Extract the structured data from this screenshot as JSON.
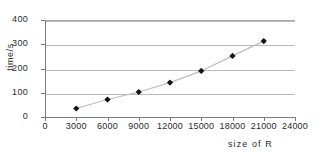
{
  "chart_data": {
    "type": "line",
    "title": "",
    "xlabel": "size of R",
    "ylabel": "time/s",
    "xlim": [
      0,
      24000
    ],
    "ylim": [
      0,
      400
    ],
    "grid": true,
    "legend": false,
    "x_ticks": [
      "0",
      "3000",
      "6000",
      "9000",
      "12000",
      "15000",
      "18000",
      "21000",
      "24000"
    ],
    "x_tick_values": [
      0,
      3000,
      6000,
      9000,
      12000,
      15000,
      18000,
      21000,
      24000
    ],
    "y_ticks": [
      "0",
      "100",
      "200",
      "300",
      "400"
    ],
    "y_tick_values": [
      0,
      100,
      200,
      300,
      400
    ],
    "x": [
      3000,
      6000,
      9000,
      12000,
      15000,
      18000,
      21000
    ],
    "values": [
      35,
      72,
      103,
      142,
      190,
      252,
      313
    ],
    "marker": "diamond",
    "marker_color": "#151515",
    "line_color": "#bdbdbd"
  }
}
